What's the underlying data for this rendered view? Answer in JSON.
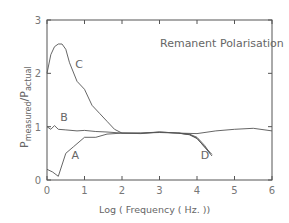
{
  "chart_data": {
    "type": "line",
    "title": "Remanent Polarisation",
    "xlabel": "Log ( Frequency ( Hz. ))",
    "ylabel": "P_measured / P_actual",
    "ylabel_main": "P",
    "ylabel_sub_num": "measured",
    "ylabel_sub_den": "actual",
    "xlim": [
      0,
      6
    ],
    "ylim": [
      0,
      3
    ],
    "xticks": [
      "0",
      "1",
      "2",
      "3",
      "4",
      "5",
      "6"
    ],
    "yticks": [
      "0",
      "1",
      "2",
      "3"
    ],
    "grid": false,
    "legend": "none (curves labelled inline A, B, C, D)",
    "series": [
      {
        "name": "A",
        "x": [
          0,
          0.15,
          0.3,
          0.5,
          0.7,
          1.0,
          1.3,
          1.6,
          2.0,
          2.5,
          3.0,
          3.5,
          3.8,
          4.0,
          4.2,
          4.4
        ],
        "y": [
          0.2,
          0.15,
          0.07,
          0.5,
          0.62,
          0.8,
          0.8,
          0.86,
          0.88,
          0.88,
          0.89,
          0.88,
          0.85,
          0.78,
          0.62,
          0.45
        ]
      },
      {
        "name": "B",
        "x": [
          0,
          0.1,
          0.2,
          0.3,
          0.5,
          0.8,
          1.0,
          1.3,
          1.6,
          2.0,
          2.5,
          3.0,
          3.5,
          4.0,
          4.5,
          5.0,
          5.5,
          6.0
        ],
        "y": [
          1.0,
          0.95,
          1.02,
          0.95,
          0.94,
          0.92,
          0.93,
          0.91,
          0.9,
          0.88,
          0.88,
          0.9,
          0.88,
          0.87,
          0.92,
          0.95,
          0.97,
          0.92
        ]
      },
      {
        "name": "C",
        "x": [
          0,
          0.1,
          0.2,
          0.3,
          0.4,
          0.5,
          0.6,
          0.8,
          1.0,
          1.2,
          1.4,
          1.6,
          1.8,
          2.0,
          2.5,
          3.0,
          3.5,
          3.8,
          4.0,
          4.2,
          4.35
        ],
        "y": [
          2.0,
          2.35,
          2.5,
          2.55,
          2.55,
          2.45,
          2.2,
          1.85,
          1.7,
          1.4,
          1.25,
          1.1,
          0.95,
          0.88,
          0.87,
          0.9,
          0.88,
          0.86,
          0.8,
          0.65,
          0.5
        ]
      },
      {
        "name": "D",
        "description": "high-frequency roll-off where curves converge and drop",
        "x": [
          3.5,
          3.8,
          4.0,
          4.2,
          4.4
        ],
        "y": [
          0.88,
          0.85,
          0.78,
          0.62,
          0.48
        ]
      }
    ],
    "annotations": [
      {
        "text": "A",
        "x": 0.65,
        "y": 0.4
      },
      {
        "text": "B",
        "x": 0.35,
        "y": 1.1
      },
      {
        "text": "C",
        "x": 0.75,
        "y": 2.1
      },
      {
        "text": "D",
        "x": 4.1,
        "y": 0.4
      }
    ]
  }
}
